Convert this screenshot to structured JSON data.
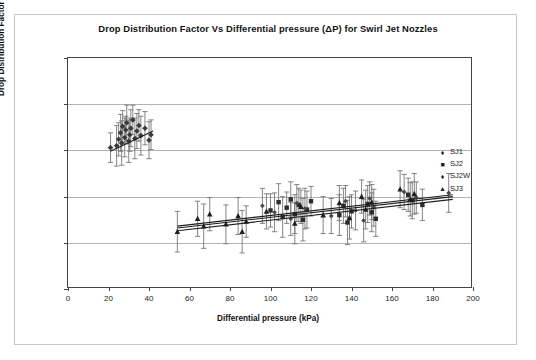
{
  "figure": {
    "title": "Drop Distribution Factor Vs Differential pressure (ΔP) for Swirl Jet Nozzles",
    "border_color": "#c8c8c8"
  },
  "legend": {
    "position": "inside-top-right",
    "items": [
      {
        "label": "SJ1",
        "marker": "diamond-marker"
      },
      {
        "label": "SJ2",
        "marker": "square-marker"
      },
      {
        "label": "SJ2W",
        "marker": "diamond-small-marker"
      },
      {
        "label": "SJ3",
        "marker": "triangle-marker"
      }
    ]
  },
  "axes": {
    "x": {
      "label": "Differential pressure (kPa)",
      "ticks": [
        "0",
        "20",
        "40",
        "60",
        "80",
        "100",
        "120",
        "140",
        "160",
        "180",
        "200"
      ],
      "min": 0,
      "max": 200
    },
    "y": {
      "label": "Drop Distribution Factor",
      "ticks": [
        "3.5",
        "4",
        "4.5",
        "5",
        "5.5",
        "6"
      ],
      "min": 3.5,
      "max": 6
    }
  },
  "chart_data": {
    "type": "scatter",
    "title": "Drop Distribution Factor Vs Differential pressure (ΔP) for Swirl Jet Nozzles",
    "xlabel": "Differential pressure (kPa)",
    "ylabel": "Drop Distribution Factor",
    "xlim": [
      0,
      200
    ],
    "ylim": [
      3.5,
      6
    ],
    "xticks": [
      0,
      20,
      40,
      60,
      80,
      100,
      120,
      140,
      160,
      180,
      200
    ],
    "yticks": [
      3.5,
      4,
      4.5,
      5,
      5.5,
      6
    ],
    "grid": "horizontal",
    "legend_position": "inside-top-right",
    "error_bars": "vertical, symmetric, ~0.1-0.3 units",
    "series": [
      {
        "name": "SJ1",
        "marker": "diamond",
        "points": [
          {
            "x": 21,
            "y": 5.03,
            "err": 0.16
          },
          {
            "x": 24,
            "y": 5.05,
            "err": 0.22
          },
          {
            "x": 25,
            "y": 5.12,
            "err": 0.18
          },
          {
            "x": 26,
            "y": 5.19,
            "err": 0.2
          },
          {
            "x": 26.5,
            "y": 5.08,
            "err": 0.24
          },
          {
            "x": 27,
            "y": 5.26,
            "err": 0.17
          },
          {
            "x": 28,
            "y": 5.14,
            "err": 0.21
          },
          {
            "x": 28.5,
            "y": 5.22,
            "err": 0.15
          },
          {
            "x": 29,
            "y": 5.3,
            "err": 0.19
          },
          {
            "x": 30,
            "y": 5.1,
            "err": 0.23
          },
          {
            "x": 30.5,
            "y": 5.17,
            "err": 0.18
          },
          {
            "x": 31,
            "y": 5.24,
            "err": 0.2
          },
          {
            "x": 32,
            "y": 5.33,
            "err": 0.16
          },
          {
            "x": 33,
            "y": 5.13,
            "err": 0.22
          },
          {
            "x": 34,
            "y": 5.21,
            "err": 0.19
          },
          {
            "x": 35,
            "y": 5.27,
            "err": 0.17
          },
          {
            "x": 36,
            "y": 5.16,
            "err": 0.21
          },
          {
            "x": 38,
            "y": 5.24,
            "err": 0.18
          },
          {
            "x": 40,
            "y": 5.11,
            "err": 0.2
          },
          {
            "x": 41,
            "y": 5.17,
            "err": 0.16
          }
        ],
        "trendline": {
          "x0": 21,
          "y0": 4.99,
          "x1": 42,
          "y1": 5.21
        }
      },
      {
        "name": "SJ2",
        "marker": "square",
        "points": [
          {
            "x": 100,
            "y": 4.35,
            "err": 0.18
          },
          {
            "x": 104,
            "y": 4.44,
            "err": 0.2
          },
          {
            "x": 106,
            "y": 4.28,
            "err": 0.22
          },
          {
            "x": 108,
            "y": 4.38,
            "err": 0.17
          },
          {
            "x": 110,
            "y": 4.47,
            "err": 0.19
          },
          {
            "x": 112,
            "y": 4.31,
            "err": 0.21
          },
          {
            "x": 114,
            "y": 4.41,
            "err": 0.18
          },
          {
            "x": 116,
            "y": 4.25,
            "err": 0.23
          },
          {
            "x": 118,
            "y": 4.36,
            "err": 0.2
          },
          {
            "x": 120,
            "y": 4.45,
            "err": 0.16
          },
          {
            "x": 134,
            "y": 4.3,
            "err": 0.22
          },
          {
            "x": 136,
            "y": 4.4,
            "err": 0.19
          },
          {
            "x": 138,
            "y": 4.22,
            "err": 0.24
          },
          {
            "x": 140,
            "y": 4.34,
            "err": 0.18
          },
          {
            "x": 148,
            "y": 4.42,
            "err": 0.2
          },
          {
            "x": 150,
            "y": 4.33,
            "err": 0.21
          },
          {
            "x": 152,
            "y": 4.26,
            "err": 0.19
          },
          {
            "x": 168,
            "y": 4.52,
            "err": 0.18
          },
          {
            "x": 170,
            "y": 4.46,
            "err": 0.2
          },
          {
            "x": 175,
            "y": 4.41,
            "err": 0.17
          }
        ],
        "trendline": {
          "x0": 54,
          "y0": 4.18,
          "x1": 190,
          "y1": 4.52
        }
      },
      {
        "name": "SJ2W",
        "marker": "diamond-small",
        "points": [
          {
            "x": 96,
            "y": 4.4,
            "err": 0.19
          },
          {
            "x": 102,
            "y": 4.33,
            "err": 0.21
          },
          {
            "x": 110,
            "y": 4.26,
            "err": 0.18
          },
          {
            "x": 113,
            "y": 4.43,
            "err": 0.2
          },
          {
            "x": 117,
            "y": 4.37,
            "err": 0.22
          },
          {
            "x": 130,
            "y": 4.29,
            "err": 0.19
          },
          {
            "x": 137,
            "y": 4.45,
            "err": 0.17
          },
          {
            "x": 142,
            "y": 4.35,
            "err": 0.21
          },
          {
            "x": 146,
            "y": 4.24,
            "err": 0.23
          },
          {
            "x": 149,
            "y": 4.48,
            "err": 0.18
          },
          {
            "x": 151,
            "y": 4.38,
            "err": 0.2
          },
          {
            "x": 166,
            "y": 4.55,
            "err": 0.19
          },
          {
            "x": 172,
            "y": 4.49,
            "err": 0.17
          },
          {
            "x": 188,
            "y": 4.54,
            "err": 0.21
          }
        ],
        "trendline": {
          "x0": 54,
          "y0": 4.13,
          "x1": 190,
          "y1": 4.47
        }
      },
      {
        "name": "SJ3",
        "marker": "triangle",
        "points": [
          {
            "x": 54,
            "y": 4.12,
            "err": 0.22
          },
          {
            "x": 64,
            "y": 4.26,
            "err": 0.19
          },
          {
            "x": 67,
            "y": 4.18,
            "err": 0.24
          },
          {
            "x": 70,
            "y": 4.31,
            "err": 0.18
          },
          {
            "x": 78,
            "y": 4.2,
            "err": 0.21
          },
          {
            "x": 84,
            "y": 4.29,
            "err": 0.2
          },
          {
            "x": 86,
            "y": 4.12,
            "err": 0.23
          },
          {
            "x": 88,
            "y": 4.23,
            "err": 0.17
          },
          {
            "x": 98,
            "y": 4.34,
            "err": 0.19
          },
          {
            "x": 112,
            "y": 4.21,
            "err": 0.22
          },
          {
            "x": 115,
            "y": 4.39,
            "err": 0.18
          },
          {
            "x": 126,
            "y": 4.3,
            "err": 0.2
          },
          {
            "x": 134,
            "y": 4.43,
            "err": 0.19
          },
          {
            "x": 139,
            "y": 4.27,
            "err": 0.23
          },
          {
            "x": 145,
            "y": 4.5,
            "err": 0.18
          },
          {
            "x": 147,
            "y": 4.36,
            "err": 0.21
          },
          {
            "x": 150,
            "y": 4.44,
            "err": 0.19
          },
          {
            "x": 164,
            "y": 4.58,
            "err": 0.2
          },
          {
            "x": 169,
            "y": 4.47,
            "err": 0.18
          },
          {
            "x": 171,
            "y": 4.53,
            "err": 0.22
          }
        ],
        "trendline": {
          "x0": 54,
          "y0": 4.16,
          "x1": 190,
          "y1": 4.5
        }
      }
    ]
  }
}
